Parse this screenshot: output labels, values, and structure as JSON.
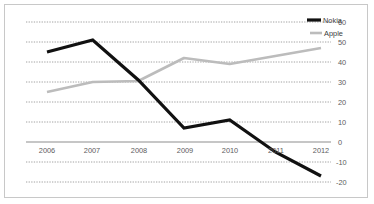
{
  "chart_data": {
    "type": "line",
    "title": "",
    "subtitle": "",
    "xlabel": "",
    "ylabel": "",
    "categories": [
      "2006",
      "2007",
      "2008",
      "2009",
      "2010",
      "2011",
      "2012"
    ],
    "x": [
      2006,
      2007,
      2008,
      2009,
      2010,
      2011,
      2012
    ],
    "series": [
      {
        "name": "Nokia",
        "color": "#111111",
        "values": [
          45,
          51,
          31,
          7,
          11,
          -5,
          -17
        ]
      },
      {
        "name": "Apple",
        "color": "#bcbcbc",
        "values": [
          25,
          30,
          30.5,
          42,
          39,
          43,
          47
        ]
      }
    ],
    "ylim": [
      -20,
      60
    ],
    "xlim": [
      2006,
      2012
    ],
    "yticks": [
      60,
      50,
      40,
      30,
      20,
      10,
      0,
      -10,
      -20
    ],
    "ytick_labels": [
      "60",
      "50",
      "40",
      "30",
      "20",
      "10",
      "0",
      "-10",
      "-20"
    ],
    "xtick_labels": [
      "2006",
      "2007",
      "2008",
      "2009",
      "2010",
      "2011",
      "2012"
    ],
    "y_axis_position": "right",
    "grid": true,
    "grid_style": "dotted-horizontal",
    "zero_line": true,
    "legend": {
      "position": "top-right",
      "entries": [
        {
          "label": "Nokia",
          "color": "#111111"
        },
        {
          "label": "Apple",
          "color": "#bcbcbc"
        }
      ]
    }
  }
}
